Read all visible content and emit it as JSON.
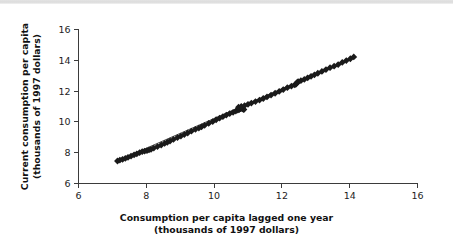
{
  "figure": {
    "background_color": "#ffffff",
    "marker_color": "#1a1a1a",
    "axis_color": "#3b3b3b",
    "top_band_color": "#e0e0e0"
  },
  "axes": {
    "x_title_line1": "Consumption per capita lagged one year",
    "x_title_line2": "(thousands of 1997 dollars)",
    "y_title_line1": "Current consumption per capita",
    "y_title_line2": "(thousands of 1997 dollars)"
  },
  "chart_data": {
    "type": "scatter",
    "title": "",
    "xlabel": "Consumption per capita lagged one year (thousands of 1997 dollars)",
    "ylabel": "Current consumption per capita (thousands of 1997 dollars)",
    "xlim": [
      6,
      16
    ],
    "ylim": [
      6,
      16
    ],
    "xticks": [
      6,
      8,
      10,
      12,
      14,
      16
    ],
    "yticks": [
      6,
      8,
      10,
      12,
      14,
      16
    ],
    "xtick_labels": [
      "6",
      "8",
      "10",
      "12",
      "14",
      "16"
    ],
    "ytick_labels": [
      "6",
      "8",
      "10",
      "12",
      "14",
      "16"
    ],
    "grid": false,
    "legend": false,
    "marker": "diamond",
    "marker_size": 3.4,
    "series": [
      {
        "name": "Consumption per capita",
        "points": [
          [
            7.15,
            7.46
          ],
          [
            7.22,
            7.52
          ],
          [
            7.3,
            7.57
          ],
          [
            7.38,
            7.63
          ],
          [
            7.46,
            7.7
          ],
          [
            7.55,
            7.78
          ],
          [
            7.64,
            7.86
          ],
          [
            7.72,
            7.93
          ],
          [
            7.8,
            8.0
          ],
          [
            7.88,
            8.07
          ],
          [
            7.95,
            8.1
          ],
          [
            8.02,
            8.14
          ],
          [
            8.08,
            8.18
          ],
          [
            8.14,
            8.22
          ],
          [
            8.22,
            8.3
          ],
          [
            8.33,
            8.4
          ],
          [
            8.44,
            8.5
          ],
          [
            8.54,
            8.6
          ],
          [
            8.62,
            8.68
          ],
          [
            8.7,
            8.76
          ],
          [
            8.8,
            8.86
          ],
          [
            8.92,
            8.98
          ],
          [
            9.02,
            9.08
          ],
          [
            9.12,
            9.18
          ],
          [
            9.22,
            9.28
          ],
          [
            9.33,
            9.4
          ],
          [
            9.45,
            9.52
          ],
          [
            9.55,
            9.6
          ],
          [
            9.63,
            9.68
          ],
          [
            9.72,
            9.78
          ],
          [
            9.84,
            9.9
          ],
          [
            9.96,
            10.02
          ],
          [
            10.06,
            10.14
          ],
          [
            10.16,
            10.24
          ],
          [
            10.26,
            10.34
          ],
          [
            10.36,
            10.44
          ],
          [
            10.46,
            10.54
          ],
          [
            10.56,
            10.62
          ],
          [
            10.64,
            10.7
          ],
          [
            10.7,
            10.76
          ],
          [
            10.74,
            10.8
          ],
          [
            10.76,
            10.84
          ],
          [
            10.78,
            10.86
          ],
          [
            10.8,
            10.88
          ],
          [
            10.82,
            10.9
          ],
          [
            10.84,
            10.86
          ],
          [
            10.86,
            10.82
          ],
          [
            10.88,
            10.8
          ],
          [
            10.78,
            10.92
          ],
          [
            10.72,
            10.95
          ],
          [
            10.8,
            11.0
          ],
          [
            10.9,
            11.06
          ],
          [
            11.0,
            11.14
          ],
          [
            11.1,
            11.22
          ],
          [
            11.22,
            11.32
          ],
          [
            11.34,
            11.42
          ],
          [
            11.45,
            11.52
          ],
          [
            11.56,
            11.62
          ],
          [
            11.68,
            11.74
          ],
          [
            11.8,
            11.86
          ],
          [
            11.92,
            11.98
          ],
          [
            12.04,
            12.1
          ],
          [
            12.16,
            12.22
          ],
          [
            12.28,
            12.32
          ],
          [
            12.38,
            12.4
          ],
          [
            12.42,
            12.46
          ],
          [
            12.44,
            12.52
          ],
          [
            12.46,
            12.58
          ],
          [
            12.48,
            12.62
          ],
          [
            12.56,
            12.68
          ],
          [
            12.66,
            12.76
          ],
          [
            12.76,
            12.86
          ],
          [
            12.86,
            12.96
          ],
          [
            12.96,
            13.06
          ],
          [
            13.06,
            13.16
          ],
          [
            13.18,
            13.28
          ],
          [
            13.3,
            13.4
          ],
          [
            13.42,
            13.52
          ],
          [
            13.54,
            13.62
          ],
          [
            13.66,
            13.72
          ],
          [
            13.78,
            13.86
          ],
          [
            13.9,
            13.98
          ],
          [
            14.02,
            14.1
          ],
          [
            14.12,
            14.22
          ]
        ]
      }
    ],
    "trend_line": {
      "x_start": 7.1,
      "y_start": 7.42,
      "x_end": 14.18,
      "y_end": 14.26
    }
  }
}
